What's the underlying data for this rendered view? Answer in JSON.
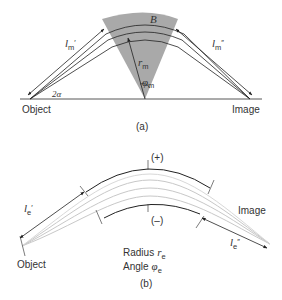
{
  "panel_a": {
    "caption": "(a)",
    "labels": {
      "object": "Object",
      "image": "Image",
      "sector": "B",
      "radius_symbol": "r",
      "radius_sub": "m",
      "angle_symbol": "φ",
      "angle_sub": "m",
      "half_angle": "2α",
      "path_in_symbol": "l",
      "path_in_sub": "m",
      "path_in_prime": "′",
      "path_out_symbol": "l",
      "path_out_sub": "m",
      "path_out_prime": "″"
    },
    "colors": {
      "sector_fill": "#a8a8a8",
      "line": "#222222"
    }
  },
  "panel_b": {
    "caption": "(b)",
    "labels": {
      "object": "Object",
      "image": "Image",
      "plus": "(+)",
      "minus": "(–)",
      "radius_text": "Radius",
      "radius_symbol": "r",
      "radius_sub": "e",
      "angle_text": "Angle",
      "angle_symbol": "φ",
      "angle_sub": "e",
      "path_in_symbol": "l",
      "path_in_sub": "e",
      "path_in_prime": "′",
      "path_out_symbol": "l",
      "path_out_sub": "e",
      "path_out_prime": "″"
    },
    "colors": {
      "beam": "#c8c8c8",
      "line": "#222222"
    }
  }
}
